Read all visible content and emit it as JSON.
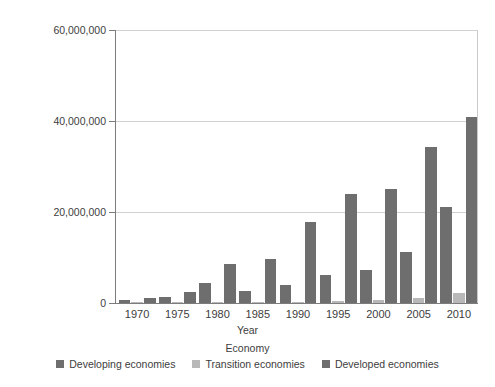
{
  "chart_data": {
    "type": "bar",
    "title": "",
    "subtitle": "",
    "xlabel": "Year",
    "ylabel": "",
    "legend_title": "Economy",
    "legend_position": "bottom",
    "grid": true,
    "grid_axis": "y",
    "ylim": [
      0,
      60000000
    ],
    "yticks": [
      0,
      20000000,
      40000000,
      60000000
    ],
    "ytick_labels": [
      "0",
      "20,000,000",
      "40,000,000",
      "60,000,000"
    ],
    "categories": [
      "1970",
      "1975",
      "1980",
      "1985",
      "1990",
      "1995",
      "2000",
      "2005",
      "2010"
    ],
    "series": [
      {
        "name": "Developing economies",
        "color": "#6e6e6e",
        "values": [
          700000,
          1400000,
          4300000,
          2600000,
          3900000,
          6100000,
          7300000,
          11300000,
          21100000
        ]
      },
      {
        "name": "Transition economies",
        "color": "#b8b8b8",
        "values": [
          60000,
          80000,
          150000,
          200000,
          300000,
          400000,
          600000,
          1100000,
          2300000
        ]
      },
      {
        "name": "Developed economies",
        "color": "#6e6e6e",
        "values": [
          1000000,
          2400000,
          8600000,
          9600000,
          17700000,
          23900000,
          25100000,
          34200000,
          40800000
        ]
      }
    ]
  }
}
